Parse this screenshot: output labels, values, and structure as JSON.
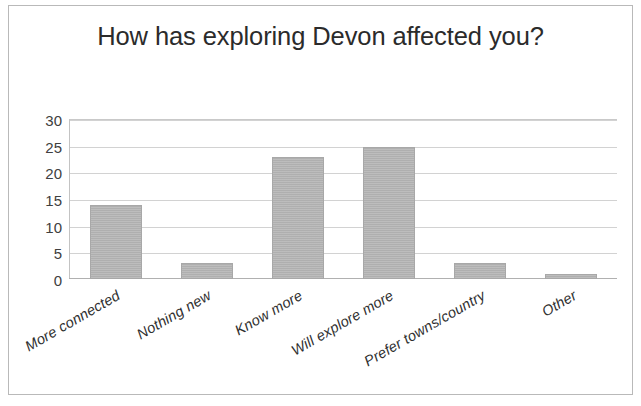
{
  "chart_data": {
    "type": "bar",
    "title": "How has exploring Devon affected you?",
    "xlabel": "",
    "ylabel": "",
    "categories": [
      "More connected",
      "Nothing new",
      "Know more",
      "Will explore more",
      "Prefer towns/country",
      "Other"
    ],
    "values": [
      14,
      3,
      23,
      25,
      3,
      1
    ],
    "ylim": [
      0,
      30
    ],
    "yticks": [
      0,
      5,
      10,
      15,
      20,
      25,
      30
    ],
    "ytick_labels": [
      "0",
      "5",
      "10",
      "15",
      "20",
      "25",
      "30"
    ],
    "grid": true,
    "legend": false,
    "bar_color": "#b5b5b5",
    "gridline_color": "#d2d2d2",
    "title_color": "#2b2b2b",
    "border_color": "#b9b9b9"
  }
}
